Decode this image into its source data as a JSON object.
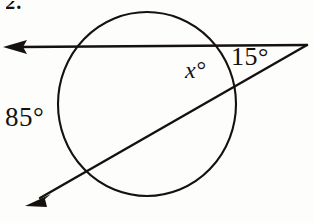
{
  "figure": {
    "problem_number": "2.",
    "background_color": "#fdfdfb",
    "ink_color": "#14110f",
    "width": 314,
    "height": 223,
    "labels": {
      "angle_x": "x°",
      "angle_15": "15°",
      "arc_85": "85°"
    },
    "geometry": {
      "circle": {
        "center_x": 147,
        "center_y": 104,
        "radius": 89,
        "stroke_width": 2.1
      },
      "line_horizontal": {
        "name": "upper-secant",
        "x1": 8,
        "y1": 47,
        "x2": 307,
        "y2": 45,
        "arrow_end": "left",
        "stroke_width": 2.4
      },
      "line_diagonal": {
        "name": "lower-secant",
        "x1": 26,
        "y1": 206,
        "x2": 307,
        "y2": 45,
        "arrow_end": "left",
        "stroke_width": 2.4
      },
      "vertex": {
        "x": 307,
        "y": 45
      },
      "intersections": {
        "upper_left": {
          "x": 78,
          "y": 47
        },
        "upper_right": {
          "x": 218,
          "y": 45
        },
        "lower_left": {
          "x": 75,
          "y": 172
        },
        "lower_right": {
          "x": 228,
          "y": 88
        }
      }
    }
  }
}
